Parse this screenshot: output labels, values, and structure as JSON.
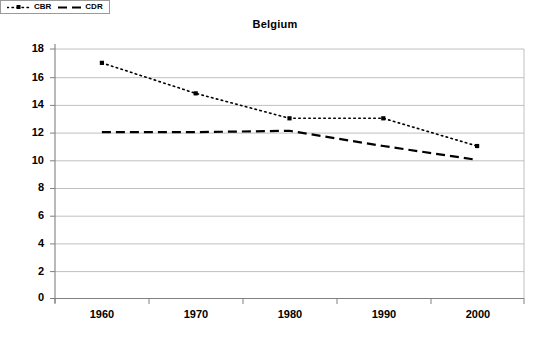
{
  "chart_data": {
    "type": "line",
    "title": "Belgium",
    "xlabel": "",
    "ylabel": "",
    "categories": [
      "1960",
      "1970",
      "1980",
      "1990",
      "2000"
    ],
    "x": [
      1960,
      1970,
      1980,
      1990,
      2000
    ],
    "series": [
      {
        "name": "CBR",
        "values": [
          17,
          14.8,
          13,
          13,
          11
        ],
        "line_style": "dotted",
        "marker": "square",
        "color": "#000000"
      },
      {
        "name": "CDR",
        "values": [
          12,
          12,
          12.1,
          11,
          10
        ],
        "line_style": "dashed",
        "marker": "none",
        "color": "#000000"
      }
    ],
    "ylim": [
      0,
      18
    ],
    "ytick_step": 2,
    "yticks": [
      "0",
      "2",
      "4",
      "6",
      "8",
      "10",
      "12",
      "14",
      "16",
      "18"
    ],
    "grid": "horizontal",
    "legend_position": "bottom",
    "plot_background": "#FFFFFF",
    "gridline_color": "#B0B0B0",
    "axis_color": "#808080"
  },
  "legend": {
    "entries": [
      {
        "label": "CBR"
      },
      {
        "label": "CDR"
      }
    ]
  }
}
